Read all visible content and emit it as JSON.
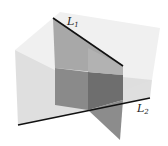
{
  "figure": {
    "labels": {
      "line1": {
        "name": "L",
        "subscript": "1"
      },
      "line2": {
        "name": "L",
        "subscript": "2"
      }
    },
    "colors": {
      "background": "#ffffff",
      "horizontal_plane": "#d9d9d9",
      "vertical_plane_upper": "#a6a6a6",
      "vertical_plane_lower": "#7f7f7f",
      "vertical_plane_right_lower": "#6e6e6e",
      "lines": "#111111"
    }
  }
}
